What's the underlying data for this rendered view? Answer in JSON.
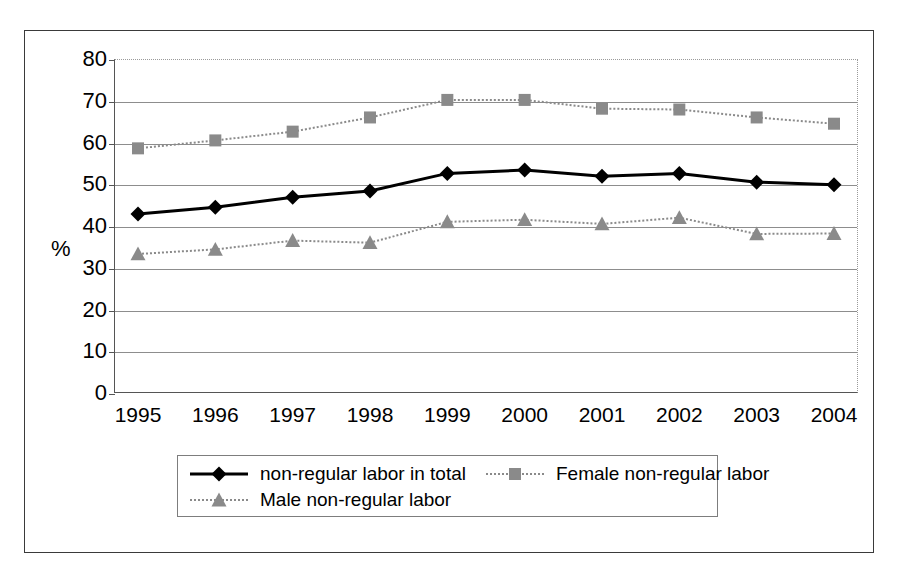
{
  "chart_data": {
    "type": "line",
    "title": "",
    "xlabel": "",
    "ylabel": "%",
    "ylim": [
      0,
      80
    ],
    "ytick_step": 10,
    "grid": true,
    "legend_position": "bottom",
    "categories": [
      "1995",
      "1996",
      "1997",
      "1998",
      "1999",
      "2000",
      "2001",
      "2002",
      "2003",
      "2004"
    ],
    "yticks": [
      "0",
      "10",
      "20",
      "30",
      "40",
      "50",
      "60",
      "70",
      "80"
    ],
    "series": [
      {
        "name": "non-regular labor in total",
        "marker": "diamond",
        "color": "#000000",
        "line_style": "solid",
        "values": [
          42.9,
          44.5,
          46.9,
          48.4,
          52.6,
          53.4,
          51.9,
          52.6,
          50.5,
          49.9
        ]
      },
      {
        "name": "Female non-regular labor",
        "marker": "square",
        "color": "#8a8a8a",
        "line_style": "dotted",
        "values": [
          58.6,
          60.5,
          62.6,
          66.0,
          70.2,
          70.2,
          68.1,
          67.9,
          66.0,
          64.5
        ]
      },
      {
        "name": "Male non-regular labor",
        "marker": "triangle",
        "color": "#8a8a8a",
        "line_style": "dotted",
        "values": [
          33.3,
          34.4,
          36.5,
          36.0,
          41.0,
          41.5,
          40.5,
          42.0,
          38.1,
          38.2
        ]
      }
    ]
  },
  "legend": {
    "entries": [
      {
        "label": "non-regular labor in total",
        "marker": "diamond-marker",
        "color": "#000000"
      },
      {
        "label": "Female non-regular labor",
        "marker": "square-marker",
        "color": "#8a8a8a"
      },
      {
        "label": "Male non-regular labor",
        "marker": "triangle-marker",
        "color": "#8a8a8a"
      }
    ]
  },
  "axis": {
    "unit_label": "%"
  }
}
